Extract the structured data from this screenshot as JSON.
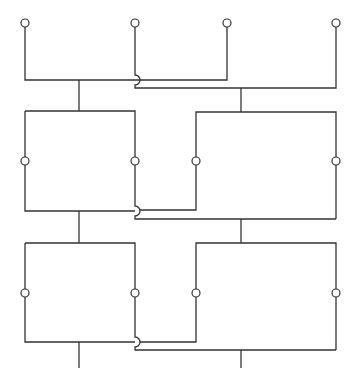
{
  "diagram": {
    "title": "",
    "colors": {
      "line": "#333333",
      "background": "#ffffff",
      "terminal_fill": "#ffffff"
    },
    "terminals": [
      {
        "id": "top-1",
        "cx": 25,
        "cy": 23
      },
      {
        "id": "top-2",
        "cx": 135,
        "cy": 23
      },
      {
        "id": "top-3",
        "cx": 227,
        "cy": 23
      },
      {
        "id": "top-4",
        "cx": 336,
        "cy": 23
      },
      {
        "id": "box1-left",
        "cx": 25,
        "cy": 161
      },
      {
        "id": "box1-right",
        "cx": 135,
        "cy": 161
      },
      {
        "id": "box2-left",
        "cx": 196,
        "cy": 161
      },
      {
        "id": "box2-right",
        "cx": 336,
        "cy": 161
      },
      {
        "id": "box3-left",
        "cx": 25,
        "cy": 293
      },
      {
        "id": "box3-right",
        "cx": 135,
        "cy": 293
      },
      {
        "id": "box4-left",
        "cx": 196,
        "cy": 293
      },
      {
        "id": "box4-right",
        "cx": 336,
        "cy": 293
      }
    ],
    "networks": [
      {
        "name": "network-a",
        "columns_x": [
          25,
          135
        ],
        "stem_x": 79
      },
      {
        "name": "network-b",
        "columns_x": [
          196,
          336
        ],
        "stem_x": 241
      }
    ]
  }
}
